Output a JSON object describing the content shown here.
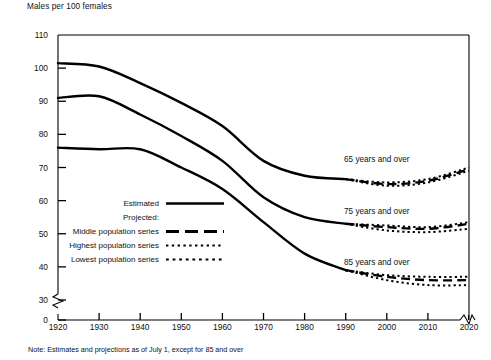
{
  "figure": {
    "axis_title": "Males per 100 females",
    "note": "Note: Estimates and projections as of July 1, except for 85 and over"
  },
  "legend": {
    "estimated_label": "Estimated",
    "projected_label": "Projected:",
    "middle_label": "Middle population series",
    "highest_label": "Highest population series",
    "lowest_label": "Lowest population series"
  },
  "series_labels": {
    "a65": "65 years and over",
    "a75": "75 years and over",
    "a85": "85 years and over"
  },
  "chart_data": {
    "type": "line",
    "title": "Males per 100 females",
    "xlabel": "",
    "ylabel": "Males per 100 females",
    "xlim": [
      1920,
      2020
    ],
    "ylim": [
      0,
      110
    ],
    "y_axis_break": true,
    "y_break_between": [
      0,
      30
    ],
    "x_axis_break_right": true,
    "grid": false,
    "legend_position": "inside-left",
    "xticks": [
      1920,
      1930,
      1940,
      1950,
      1960,
      1970,
      1980,
      1990,
      2000,
      2010,
      2020
    ],
    "yticks": [
      0,
      30,
      40,
      50,
      60,
      70,
      80,
      90,
      100,
      110
    ],
    "annotations": [
      "65 years and over",
      "75 years and over",
      "85 years and over"
    ],
    "series": [
      {
        "name": "65 years and over — Estimated",
        "group": "65 years and over",
        "style": "solid",
        "x": [
          1920,
          1930,
          1940,
          1950,
          1960,
          1970,
          1980,
          1990
        ],
        "values": [
          101.5,
          100.5,
          95.5,
          89.5,
          82.5,
          72.0,
          67.5,
          66.5
        ]
      },
      {
        "name": "65 years and over — Middle population series",
        "group": "65 years and over",
        "style": "dashed",
        "x": [
          1990,
          2000,
          2010,
          2020
        ],
        "values": [
          66.5,
          65.0,
          66.0,
          69.5
        ]
      },
      {
        "name": "65 years and over — Highest population series",
        "group": "65 years and over",
        "style": "dotted",
        "x": [
          1990,
          2000,
          2010,
          2020
        ],
        "values": [
          66.5,
          65.5,
          66.5,
          70.0
        ]
      },
      {
        "name": "65 years and over — Lowest population series",
        "group": "65 years and over",
        "style": "dotted",
        "x": [
          1990,
          2000,
          2010,
          2020
        ],
        "values": [
          66.5,
          64.5,
          65.5,
          69.0
        ]
      },
      {
        "name": "75 years and over — Estimated",
        "group": "75 years and over",
        "style": "solid",
        "x": [
          1920,
          1930,
          1940,
          1950,
          1960,
          1970,
          1980,
          1990
        ],
        "values": [
          91.0,
          91.5,
          86.0,
          79.5,
          72.0,
          61.0,
          55.0,
          53.0
        ]
      },
      {
        "name": "75 years and over — Middle population series",
        "group": "75 years and over",
        "style": "dashed",
        "x": [
          1990,
          2000,
          2010,
          2020
        ],
        "values": [
          53.0,
          52.0,
          51.5,
          53.0
        ]
      },
      {
        "name": "75 years and over — Highest population series",
        "group": "75 years and over",
        "style": "dotted",
        "x": [
          1990,
          2000,
          2010,
          2020
        ],
        "values": [
          53.0,
          52.5,
          52.0,
          53.5
        ]
      },
      {
        "name": "75 years and over — Lowest population series",
        "group": "75 years and over",
        "style": "dotted",
        "x": [
          1990,
          2000,
          2010,
          2020
        ],
        "values": [
          53.0,
          51.0,
          50.5,
          51.5
        ]
      },
      {
        "name": "85 years and over — Estimated",
        "group": "85 years and over",
        "style": "solid",
        "x": [
          1920,
          1930,
          1940,
          1950,
          1960,
          1970,
          1980,
          1990
        ],
        "values": [
          76.0,
          75.5,
          75.5,
          70.0,
          63.5,
          53.5,
          44.0,
          39.0
        ]
      },
      {
        "name": "85 years and over — Middle population series",
        "group": "85 years and over",
        "style": "dashed",
        "x": [
          1990,
          2000,
          2010,
          2020
        ],
        "values": [
          39.0,
          37.0,
          36.0,
          36.0
        ]
      },
      {
        "name": "85 years and over — Highest population series",
        "group": "85 years and over",
        "style": "dotted",
        "x": [
          1990,
          2000,
          2010,
          2020
        ],
        "values": [
          39.0,
          37.5,
          37.0,
          37.0
        ]
      },
      {
        "name": "85 years and over — Lowest population series",
        "group": "85 years and over",
        "style": "dotted",
        "x": [
          1990,
          2000,
          2010,
          2020
        ],
        "values": [
          39.0,
          36.0,
          34.5,
          34.5
        ]
      }
    ]
  }
}
